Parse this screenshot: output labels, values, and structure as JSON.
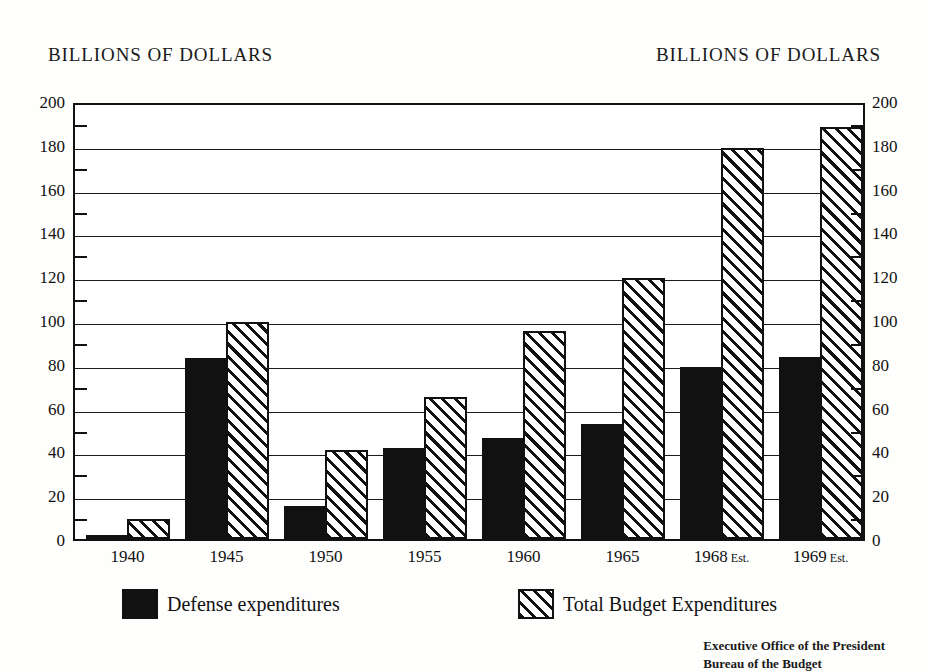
{
  "header": {
    "left_title": "BILLIONS OF DOLLARS",
    "right_title": "BILLIONS OF DOLLARS"
  },
  "source_note": {
    "line1": "Executive Office of the President",
    "line2": "Bureau of the Budget"
  },
  "legend": {
    "items": [
      {
        "label": "Defense expenditures",
        "swatch": "solid-black",
        "color": "#111111"
      },
      {
        "label": "Total Budget Expenditures",
        "swatch": "diagonal-hatch",
        "color": "#111111"
      }
    ]
  },
  "chart_data": {
    "type": "bar",
    "title": "BILLIONS OF DOLLARS",
    "xlabel": "",
    "ylabel": "BILLIONS OF DOLLARS",
    "ylim": [
      0,
      200
    ],
    "ytick_step": 20,
    "yminor_step": 10,
    "grid": true,
    "legend_position": "bottom",
    "dual_axis": true,
    "categories": [
      "1940",
      "1945",
      "1950",
      "1955",
      "1960",
      "1965",
      "1968 Est.",
      "1969 Est."
    ],
    "category_labels": [
      {
        "year": "1940",
        "suffix": ""
      },
      {
        "year": "1945",
        "suffix": ""
      },
      {
        "year": "1950",
        "suffix": ""
      },
      {
        "year": "1955",
        "suffix": ""
      },
      {
        "year": "1960",
        "suffix": ""
      },
      {
        "year": "1965",
        "suffix": ""
      },
      {
        "year": "1968",
        "suffix": "Est."
      },
      {
        "year": "1969",
        "suffix": "Est."
      }
    ],
    "yticks": [
      0,
      20,
      40,
      60,
      80,
      100,
      120,
      140,
      160,
      180,
      200
    ],
    "ytick_labels": [
      "0",
      "20",
      "40",
      "60",
      "80",
      "100",
      "120",
      "140",
      "160",
      "180",
      "200"
    ],
    "yminor_ticks": [
      10,
      30,
      50,
      70,
      90,
      110,
      130,
      150,
      170,
      190
    ],
    "series": [
      {
        "name": "Defense expenditures",
        "style": "solid-black",
        "values": [
          1.7,
          82.5,
          15.0,
          41.5,
          46.0,
          52.5,
          78.5,
          83.0
        ]
      },
      {
        "name": "Total Budget Expenditures",
        "style": "diagonal-hatch",
        "values": [
          9.0,
          99.0,
          40.5,
          65.0,
          95.0,
          119.0,
          178.5,
          188.0
        ]
      }
    ]
  }
}
